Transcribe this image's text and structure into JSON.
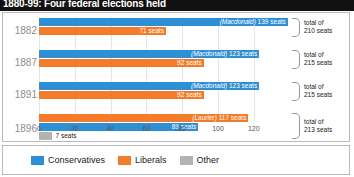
{
  "header": {
    "title": "1880-99: Four federal elections held"
  },
  "legend": {
    "items": [
      {
        "label": "Conservatives",
        "color": "#2f8fd4",
        "key": "conservatives"
      },
      {
        "label": "Liberals",
        "color": "#f47b29",
        "key": "liberals"
      },
      {
        "label": "Other",
        "color": "#b3b3b3",
        "key": "other"
      }
    ]
  },
  "axis": {
    "ticks": [
      "0",
      "20",
      "40",
      "60",
      "80",
      "100",
      "120"
    ]
  },
  "rows": [
    {
      "year": "1882",
      "total_line1": "total of",
      "total_line2": "210 seats",
      "bars": [
        {
          "party": "Conservatives",
          "leader": "(Macdonald)",
          "label": "(Macdonald) 139 seats",
          "value_label": "139 seats",
          "value": 139
        },
        {
          "party": "Liberals",
          "leader": "",
          "label": "71 seats",
          "value_label": "71 seats",
          "value": 71
        }
      ]
    },
    {
      "year": "1887",
      "total_line1": "total of",
      "total_line2": "215 seats",
      "bars": [
        {
          "party": "Conservatives",
          "leader": "(Macdonald)",
          "label": "(Macdonald) 123 seats",
          "value_label": "123 seats",
          "value": 123
        },
        {
          "party": "Liberals",
          "leader": "",
          "label": "92 seats",
          "value_label": "92 seats",
          "value": 92
        }
      ]
    },
    {
      "year": "1891",
      "total_line1": "total of",
      "total_line2": "215 seats",
      "bars": [
        {
          "party": "Conservatives",
          "leader": "(Macdonald)",
          "label": "(Macdonald) 123 seats",
          "value_label": "123 seats",
          "value": 123
        },
        {
          "party": "Liberals",
          "leader": "",
          "label": "92 seats",
          "value_label": "92 seats",
          "value": 92
        }
      ]
    },
    {
      "year": "1896",
      "total_line1": "total of",
      "total_line2": "213 seats",
      "bars": [
        {
          "party": "Liberals",
          "leader": "(Laurier)",
          "label": "(Laurier) 117 seats",
          "value_label": "117 seats",
          "value": 117
        },
        {
          "party": "Conservatives",
          "leader": "",
          "label": "89 seats",
          "value_label": "89 seats",
          "value": 89
        },
        {
          "party": "Other",
          "leader": "",
          "label": "7 seats",
          "value_label": "7 seats",
          "value": 7
        }
      ]
    }
  ],
  "chart_data": {
    "type": "bar",
    "title": "1880-99: Four federal elections held",
    "orientation": "horizontal",
    "xlabel": "",
    "ylabel": "",
    "xlim": [
      0,
      144
    ],
    "grid": true,
    "legend_position": "bottom-left",
    "categories": [
      "1882",
      "1887",
      "1891",
      "1896"
    ],
    "xticks": [
      0,
      20,
      40,
      60,
      80,
      100,
      120
    ],
    "series": [
      {
        "name": "Conservatives",
        "color": "#2f8fd4",
        "values": [
          139,
          123,
          123,
          89
        ]
      },
      {
        "name": "Liberals",
        "color": "#f47b29",
        "values": [
          71,
          92,
          92,
          117
        ]
      },
      {
        "name": "Other",
        "color": "#b3b3b3",
        "values": [
          0,
          0,
          0,
          7
        ]
      }
    ],
    "annotations": [
      {
        "category": "1882",
        "text": "(Macdonald) 139 seats",
        "series": "Conservatives"
      },
      {
        "category": "1882",
        "text": "71 seats",
        "series": "Liberals"
      },
      {
        "category": "1882",
        "text": "total of 210 seats",
        "series": "total"
      },
      {
        "category": "1887",
        "text": "(Macdonald) 123 seats",
        "series": "Conservatives"
      },
      {
        "category": "1887",
        "text": "92 seats",
        "series": "Liberals"
      },
      {
        "category": "1887",
        "text": "total of 215 seats",
        "series": "total"
      },
      {
        "category": "1891",
        "text": "(Macdonald) 123 seats",
        "series": "Conservatives"
      },
      {
        "category": "1891",
        "text": "92 seats",
        "series": "Liberals"
      },
      {
        "category": "1891",
        "text": "total of 215 seats",
        "series": "total"
      },
      {
        "category": "1896",
        "text": "(Laurier) 117 seats",
        "series": "Liberals"
      },
      {
        "category": "1896",
        "text": "89 seats",
        "series": "Conservatives"
      },
      {
        "category": "1896",
        "text": "7 seats",
        "series": "Other"
      },
      {
        "category": "1896",
        "text": "total of 213 seats",
        "series": "total"
      }
    ],
    "totals": [
      210,
      215,
      215,
      213
    ]
  }
}
